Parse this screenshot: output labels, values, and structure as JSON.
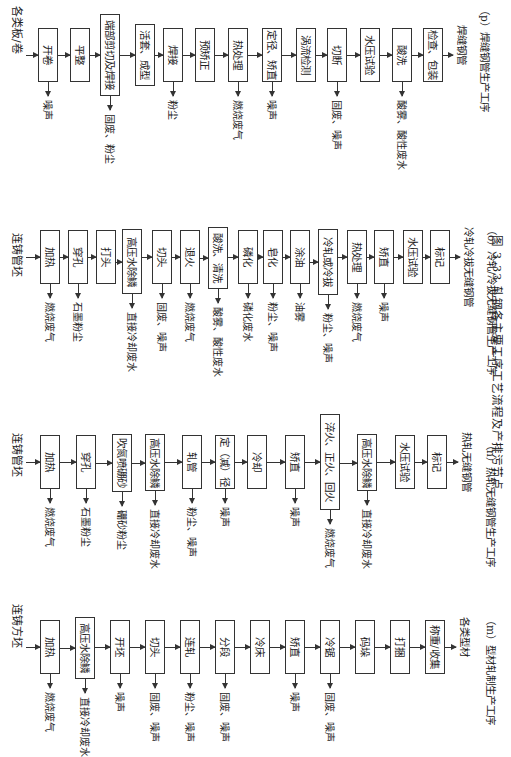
{
  "figure_caption": "图 3.33  轧钢各主要工序工艺流程及产排污节点",
  "flows": [
    {
      "id": "p",
      "input": "各类板/卷",
      "output": "焊缝钢管",
      "caption": "（p）焊缝钢管生产工序",
      "steps": [
        {
          "label": "开卷",
          "emission": "噪声"
        },
        {
          "label": "平整",
          "emission": ""
        },
        {
          "label": "端部剪切及焊接",
          "emission": "固废、粉尘"
        },
        {
          "label": "活套、成型",
          "emission": ""
        },
        {
          "label": "焊接",
          "emission": "粉尘"
        },
        {
          "label": "预矫正",
          "emission": ""
        },
        {
          "label": "热处理",
          "emission": "燃烧废气"
        },
        {
          "label": "定径、矫直",
          "emission": "噪声"
        },
        {
          "label": "涡流检测",
          "emission": ""
        },
        {
          "label": "切断",
          "emission": "固废、噪声"
        },
        {
          "label": "水压试验",
          "emission": ""
        },
        {
          "label": "酸洗",
          "emission": "酸雾、酸性废水"
        },
        {
          "label": "检查、包装",
          "emission": ""
        }
      ]
    },
    {
      "id": "o",
      "input": "连铸管坯",
      "output": "冷轧冷拔无缝钢管",
      "caption": "（o）冷轧/冷拔无缝钢管生产工序",
      "steps": [
        {
          "label": "加热",
          "emission": "燃烧废气"
        },
        {
          "label": "穿孔",
          "emission": "石墨粉尘"
        },
        {
          "label": "打头",
          "emission": ""
        },
        {
          "label": "高压水除鳞",
          "emission": "直接冷却废水"
        },
        {
          "label": "切头",
          "emission": "固废、噪声"
        },
        {
          "label": "退火",
          "emission": "燃烧废气"
        },
        {
          "label": "酸洗、清洗",
          "emission": "酸雾、酸性废水"
        },
        {
          "label": "磷化",
          "emission": "磷化废水"
        },
        {
          "label": "皂化",
          "emission": "粉尘、噪声"
        },
        {
          "label": "涂油",
          "emission": "油雾"
        },
        {
          "label": "冷轧或冷拔",
          "emission": "粉尘、噪声"
        },
        {
          "label": "热处理",
          "emission": "燃烧废气"
        },
        {
          "label": "矫直",
          "emission": "噪声"
        },
        {
          "label": "水压试验",
          "emission": ""
        },
        {
          "label": "标记",
          "emission": ""
        }
      ]
    },
    {
      "id": "n",
      "input": "连铸管坯",
      "output": "热轧无缝钢管",
      "caption": "（n）热轧无缝钢管生产工序",
      "steps": [
        {
          "label": "加热",
          "emission": "燃烧废气"
        },
        {
          "label": "穿孔",
          "emission": "石墨粉尘"
        },
        {
          "label": "吹氮喷硼砂",
          "emission": "硼砂粉尘"
        },
        {
          "label": "高压水除鳞",
          "emission": "直接冷却废水"
        },
        {
          "label": "轧管",
          "emission": "粉尘、噪声"
        },
        {
          "label": "定（减）径",
          "emission": "噪声"
        },
        {
          "label": "冷却",
          "emission": ""
        },
        {
          "label": "矫直",
          "emission": "噪声"
        },
        {
          "label": "淬火、正火、回火",
          "emission": "燃烧废气"
        },
        {
          "label": "高压水除鳞",
          "emission": "直接冷却废水"
        },
        {
          "label": "水压试验",
          "emission": ""
        },
        {
          "label": "标记",
          "emission": ""
        }
      ]
    },
    {
      "id": "m",
      "input": "连铸方坯",
      "output": "各类型材",
      "caption": "（m）型材轧制生产工序",
      "steps": [
        {
          "label": "加热",
          "emission": "燃烧废气"
        },
        {
          "label": "高压水除鳞",
          "emission": "直接冷却废水"
        },
        {
          "label": "开坯",
          "emission": "噪声"
        },
        {
          "label": "切头",
          "emission": "固废、噪声"
        },
        {
          "label": "连轧",
          "emission": "粉尘、噪声"
        },
        {
          "label": "分段",
          "emission": "固废、噪声"
        },
        {
          "label": "冷床",
          "emission": ""
        },
        {
          "label": "矫直",
          "emission": "噪声"
        },
        {
          "label": "冷锯",
          "emission": "固废、噪声"
        },
        {
          "label": "码垛",
          "emission": ""
        },
        {
          "label": "打捆",
          "emission": ""
        },
        {
          "label": "称重/收集",
          "emission": ""
        }
      ]
    }
  ]
}
